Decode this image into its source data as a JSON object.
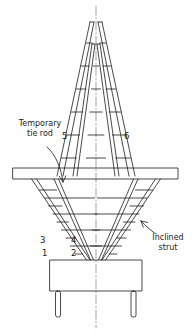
{
  "figure": {
    "kind": "engineering-line-drawing",
    "line_color": "#1a1a1a",
    "background_color": "#ffffff",
    "centerline_style": "dash-dot"
  },
  "annotations": {
    "temporary_tie_rod": {
      "line1": "Temporary",
      "line2": "tie rod"
    },
    "inclined_strut": {
      "line1": "Inclined",
      "line2": "strut"
    }
  },
  "member_numbers": [
    {
      "id": "1",
      "label": "1"
    },
    {
      "id": "2",
      "label": "2"
    },
    {
      "id": "3",
      "label": "3"
    },
    {
      "id": "4",
      "label": "4"
    },
    {
      "id": "5",
      "label": "5"
    },
    {
      "id": "6",
      "label": "6"
    }
  ]
}
